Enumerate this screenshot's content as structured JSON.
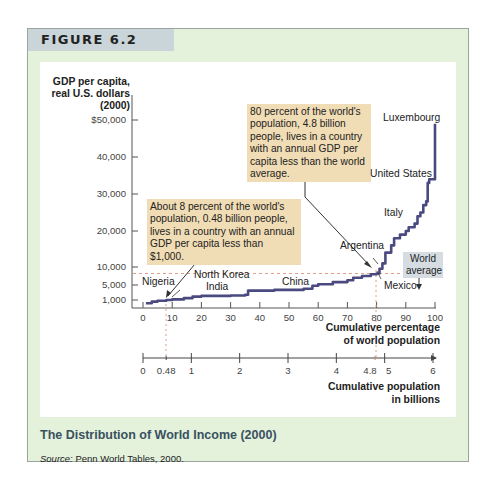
{
  "figure": {
    "label": "FIGURE 6.2",
    "caption": "The Distribution of World Income (2000)",
    "source_prefix": "Source:",
    "source_text": " Penn World Tables, 2000."
  },
  "colors": {
    "frame_bg": "#e4f2dc",
    "header_band": "#c9d5d8",
    "curve": "#4a4a80",
    "annotation_bg": "#f1ddb5",
    "world_average_bg": "#d5dde2",
    "reference_line": "#e0a08a",
    "caption": "#3a5160"
  },
  "chart_data": {
    "type": "line",
    "title": "The Distribution of World Income (2000)",
    "ylabel": "GDP per capita, real U.S. dollars (2000)",
    "xlabel": "Cumulative percentage of world population",
    "x2label": "Cumulative population in billions",
    "y_ticks": [
      "$50,000",
      "40,000",
      "30,000",
      "20,000",
      "10,000",
      "5,000",
      "1,000"
    ],
    "x_ticks": [
      "0",
      "10",
      "20",
      "30",
      "40",
      "50",
      "60",
      "70",
      "80",
      "90",
      "100"
    ],
    "x2_ticks": [
      "0",
      "0.48",
      "1",
      "2",
      "3",
      "4",
      "4.8",
      "5",
      "6"
    ],
    "xlim": [
      0,
      100
    ],
    "ylim": [
      0,
      52000
    ],
    "world_average": 8200,
    "series": [
      {
        "name": "GDP per capita by cumulative population",
        "x": [
          1,
          3,
          5,
          8,
          10,
          14,
          17,
          20,
          30,
          35,
          36,
          45,
          55,
          58,
          60,
          65,
          70,
          72,
          75,
          78,
          80,
          81,
          82,
          83,
          85,
          86,
          88,
          90,
          91,
          93,
          94,
          95,
          96,
          97,
          97.5,
          98,
          99,
          100
        ],
        "y": [
          600,
          800,
          900,
          1000,
          1150,
          1500,
          1900,
          2100,
          2200,
          2400,
          3500,
          3700,
          4000,
          4800,
          5200,
          5800,
          6300,
          7000,
          7500,
          8000,
          8200,
          9500,
          11000,
          14000,
          16000,
          18000,
          19000,
          20000,
          21000,
          22000,
          24000,
          25000,
          27000,
          28000,
          33000,
          34000,
          34000,
          49000
        ]
      }
    ],
    "annotations": [
      {
        "text": "About 8 percent of the world's population, 0.48 billion people, lives in a country with an annual GDP per capita less than $1,000.",
        "points_to": [
          8,
          1000
        ]
      },
      {
        "text": "80 percent of the world's population, 4.8 billion people, lives in a country with an annual GDP per capita less than the world average.",
        "points_to": [
          80,
          8200
        ]
      }
    ],
    "country_labels": [
      "Luxembourg",
      "United States",
      "Italy",
      "Argentina",
      "Mexico",
      "China",
      "India",
      "North Korea",
      "Nigeria"
    ]
  },
  "labels": {
    "ytitle_line1": "GDP per capita,",
    "ytitle_line2": "real U.S. dollars",
    "ytitle_line3": "(2000)",
    "ann_80": "80 percent of the world's population, 4.8 billion people, lives in a country with an annual GDP per capita less than the world average.",
    "ann_8": "About 8 percent of the world's population, 0.48 billion people, lives in a country with an annual GDP per capita less than $1,000.",
    "world_average": "World average",
    "luxembourg": "Luxembourg",
    "united_states": "United States",
    "italy": "Italy",
    "argentina": "Argentina",
    "mexico": "Mexico",
    "china": "China",
    "india": "India",
    "north_korea": "North Korea",
    "nigeria": "Nigeria",
    "xtitle_line1": "Cumulative percentage",
    "xtitle_line2": "of world population",
    "x2title_line1": "Cumulative population",
    "x2title_line2": "in billions"
  }
}
